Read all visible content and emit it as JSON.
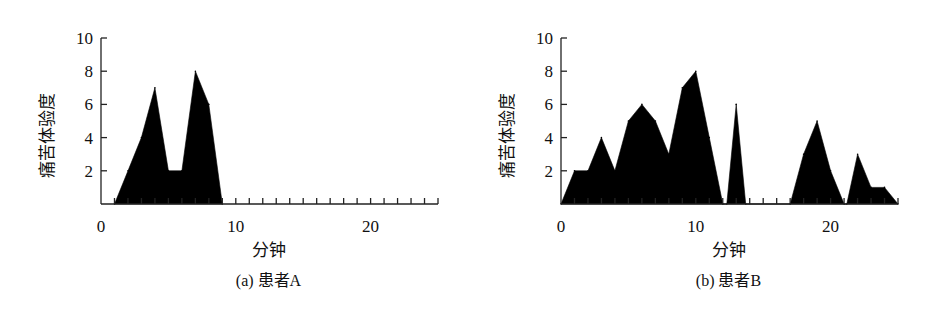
{
  "chart_data": [
    {
      "type": "area",
      "caption": "(a) 患者A",
      "xlabel": "分钟",
      "ylabel": "痛苦体验度",
      "xlim": [
        0,
        25
      ],
      "ylim": [
        0,
        10
      ],
      "xticks": [
        0,
        10,
        20
      ],
      "yticks": [
        2,
        4,
        6,
        8,
        10
      ],
      "x_minor_step": 1,
      "grid": false,
      "fill_color": "#000000",
      "series": [
        {
          "name": "患者A",
          "x": [
            1,
            2,
            3,
            4,
            5,
            6,
            7,
            8,
            9
          ],
          "y": [
            0,
            2,
            4,
            7,
            2,
            2,
            8,
            6,
            0
          ]
        }
      ]
    },
    {
      "type": "area",
      "caption": "(b) 患者B",
      "xlabel": "分钟",
      "ylabel": "痛苦体验度",
      "xlim": [
        0,
        25
      ],
      "ylim": [
        0,
        10
      ],
      "xticks": [
        0,
        10,
        20
      ],
      "yticks": [
        2,
        4,
        6,
        8,
        10
      ],
      "x_minor_step": 1,
      "grid": false,
      "fill_color": "#000000",
      "series": [
        {
          "name": "患者B",
          "x": [
            0,
            1,
            2,
            3,
            4,
            5,
            6,
            7,
            8,
            9,
            10,
            11,
            12,
            12.3,
            13,
            13.7,
            17,
            18,
            19,
            20,
            21,
            21.2,
            22,
            23,
            24,
            25
          ],
          "y": [
            0,
            2,
            2,
            4,
            2,
            5,
            6,
            5,
            3,
            7,
            8,
            4,
            0,
            0,
            6,
            0,
            0,
            3,
            5,
            2,
            0,
            0,
            3,
            1,
            1,
            0
          ]
        }
      ]
    }
  ]
}
